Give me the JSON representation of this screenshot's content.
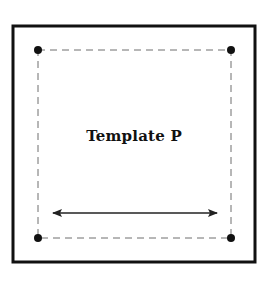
{
  "diagram": {
    "title": "Template P",
    "colors": {
      "frame": "#111111",
      "dashed_guide": "#6e6e6e",
      "dots": "#111111",
      "arrow": "#222222",
      "background": "#ffffff"
    },
    "frame": {
      "x": 13,
      "y": 26,
      "width": 242,
      "height": 236,
      "stroke_width": 3
    },
    "guide_rectangle": {
      "x": 38,
      "y": 50,
      "width": 193,
      "height": 188,
      "dashed": true
    },
    "corner_dots": [
      {
        "name": "top-left",
        "cx": 38,
        "cy": 50
      },
      {
        "name": "top-right",
        "cx": 231,
        "cy": 50
      },
      {
        "name": "bottom-left",
        "cx": 38,
        "cy": 238
      },
      {
        "name": "bottom-right",
        "cx": 231,
        "cy": 238
      }
    ],
    "arrow": {
      "x1": 52,
      "x2": 218,
      "y": 213,
      "double_headed": true
    }
  }
}
